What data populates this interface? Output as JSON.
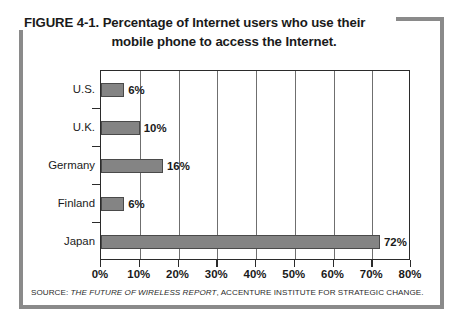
{
  "figure": {
    "title_line_1": "FIGURE 4-1. Percentage of Internet users who use their",
    "title_line_2": "mobile phone to access the Internet.",
    "source_prefix": "SOURCE: ",
    "source_report_title": "THE FUTURE OF WIRELESS REPORT",
    "source_suffix": ", ACCENTURE INSTITUTE FOR STRATEGIC CHANGE."
  },
  "colors": {
    "bar_fill": "#848484",
    "bar_stroke": "#4a4a4a",
    "axis": "#2b2b2b",
    "gridline": "#6f6f6f",
    "frame": "#8a8a8a",
    "text": "#1a1a1a",
    "background": "#ffffff"
  },
  "chart_data": {
    "type": "bar",
    "orientation": "horizontal",
    "title": "FIGURE 4-1. Percentage of Internet users who use their mobile phone to access the Internet.",
    "xlabel": "",
    "ylabel": "",
    "categories": [
      "U.S.",
      "U.K.",
      "Germany",
      "Finland",
      "Japan"
    ],
    "values": [
      6,
      10,
      16,
      6,
      72
    ],
    "value_labels": [
      "6%",
      "10%",
      "16%",
      "6%",
      "72%"
    ],
    "xlim": [
      0,
      80
    ],
    "xticks": [
      0,
      10,
      20,
      30,
      40,
      50,
      60,
      70,
      80
    ],
    "xtick_labels": [
      "0%",
      "10%",
      "20%",
      "30%",
      "40%",
      "50%",
      "60%",
      "70%",
      "80%"
    ],
    "grid": true,
    "grid_axis": "x",
    "legend": false,
    "units": "percent"
  }
}
